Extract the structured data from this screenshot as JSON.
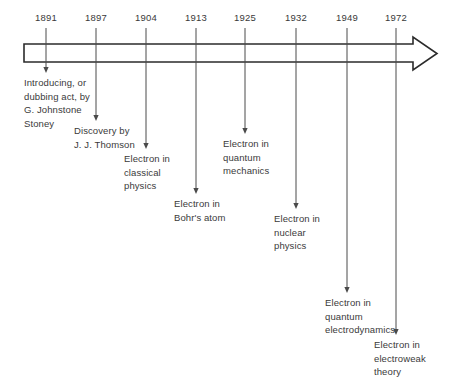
{
  "diagram": {
    "type": "timeline",
    "axis": {
      "orientation": "horizontal",
      "direction": "left-to-right",
      "style": "outline-arrow",
      "stroke_color": "#2b2b2b",
      "fill_color": "#ffffff"
    },
    "text_color": "#3a3a3a",
    "background_color": "#ffffff",
    "events": [
      {
        "year": "1891",
        "label": "Introducing, or\ndubbing act, by\nG. Johnstone\nStoney",
        "tick_x": 46,
        "text_x": 24,
        "text_y": 76,
        "leader_end_y": 73
      },
      {
        "year": "1897",
        "label": "Discovery by\nJ. J. Thomson",
        "tick_x": 96,
        "text_x": 74,
        "text_y": 124,
        "leader_end_y": 121
      },
      {
        "year": "1904",
        "label": "Electron in\nclassical\nphysics",
        "tick_x": 146,
        "text_x": 124,
        "text_y": 152,
        "leader_end_y": 149
      },
      {
        "year": "1913",
        "label": "Electron in\nBohr's atom",
        "tick_x": 196,
        "text_x": 174,
        "text_y": 197,
        "leader_end_y": 194
      },
      {
        "year": "1925",
        "label": "Electron in\nquantum\nmechanics",
        "tick_x": 245,
        "text_x": 223,
        "text_y": 137,
        "leader_end_y": 134
      },
      {
        "year": "1932",
        "label": "Electron in\nnuclear\nphysics",
        "tick_x": 296,
        "text_x": 274,
        "text_y": 212,
        "leader_end_y": 209
      },
      {
        "year": "1949",
        "label": "Electron in\nquantum\nelectrodynamics",
        "tick_x": 347,
        "text_x": 325,
        "text_y": 296,
        "leader_end_y": 293
      },
      {
        "year": "1972",
        "label": "Electron in\nelectroweak\ntheory",
        "tick_x": 396,
        "text_x": 374,
        "text_y": 338,
        "leader_end_y": 335
      }
    ]
  }
}
